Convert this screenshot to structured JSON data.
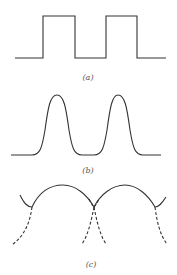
{
  "figure": {
    "panels": [
      {
        "id": "a",
        "label": "(a)",
        "description": "square wave",
        "waveform": "square"
      },
      {
        "id": "b",
        "label": "(b)",
        "description": "rounded pulse train",
        "waveform": "rounded-pulses"
      },
      {
        "id": "c",
        "label": "(c)",
        "description": "overlapping arcs with dashed continuations",
        "waveform": "arcs"
      }
    ],
    "colors": {
      "line": "#333333",
      "background": "#ffffff",
      "label": "#555555"
    }
  }
}
